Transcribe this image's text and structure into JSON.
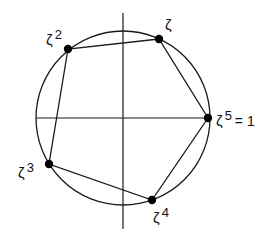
{
  "diagram": {
    "circle": {
      "cx": 123,
      "cy": 118,
      "r": 87
    },
    "axes": {
      "horizontal": {
        "x1": 36,
        "x2": 209,
        "y": 118
      },
      "vertical": {
        "x": 123,
        "y1": 13,
        "y2": 229
      }
    },
    "points": [
      {
        "name": "zeta-1",
        "x": 159,
        "y": 39,
        "label_base": "ζ",
        "label_sup": "",
        "label_suffix": "",
        "lx": 165,
        "ly": 30
      },
      {
        "name": "zeta-2",
        "x": 68,
        "y": 49,
        "label_base": "ζ",
        "label_sup": "2",
        "label_suffix": "",
        "lx": 46,
        "ly": 45
      },
      {
        "name": "zeta-3",
        "x": 49,
        "y": 164,
        "label_base": "ζ",
        "label_sup": "3",
        "label_suffix": "",
        "lx": 18,
        "ly": 178
      },
      {
        "name": "zeta-4",
        "x": 152,
        "y": 200,
        "label_base": "ζ",
        "label_sup": "4",
        "label_suffix": "",
        "lx": 153,
        "ly": 223
      },
      {
        "name": "zeta-5",
        "x": 208,
        "y": 118,
        "label_base": "ζ",
        "label_sup": "5",
        "label_suffix": "= 1",
        "lx": 216,
        "ly": 126
      }
    ],
    "polygon_order": [
      "zeta-1",
      "zeta-2",
      "zeta-3",
      "zeta-4",
      "zeta-5"
    ],
    "colors": {
      "stroke": "#1a1a1a",
      "dot": "#000000",
      "background": "#ffffff"
    }
  }
}
